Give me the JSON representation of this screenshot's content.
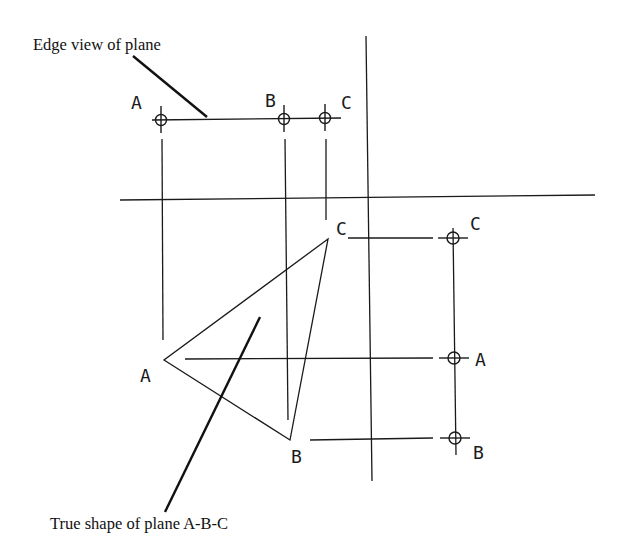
{
  "diagram": {
    "type": "descriptive-geometry-construction",
    "annotations": {
      "edge_view": "Edge view of plane",
      "true_shape": "True shape of plane A-B-C"
    },
    "reference_lines": {
      "vertical_fold_line": {
        "x1": 366,
        "y1": 36,
        "x2": 372,
        "y2": 481
      },
      "horizontal_fold_line": {
        "x1": 120,
        "y1": 200,
        "x2": 595,
        "y2": 195
      }
    },
    "top_view": {
      "description": "Edge view of plane (points collinear)",
      "points": [
        {
          "label": "A",
          "x": 161,
          "y": 120,
          "label_x": 131,
          "label_y": 109
        },
        {
          "label": "B",
          "x": 284,
          "y": 119,
          "label_x": 265,
          "label_y": 107
        },
        {
          "label": "C",
          "x": 325,
          "y": 118,
          "label_x": 341,
          "label_y": 109
        }
      ],
      "edge_line": {
        "x1": 152,
        "y1": 120,
        "x2": 341,
        "y2": 118
      }
    },
    "true_shape_view": {
      "description": "True shape triangle A-B-C",
      "points": [
        {
          "label": "A",
          "x": 164,
          "y": 360,
          "label_x": 140,
          "label_y": 382
        },
        {
          "label": "B",
          "x": 290,
          "y": 440,
          "label_x": 291,
          "label_y": 463
        },
        {
          "label": "C",
          "x": 328,
          "y": 239,
          "label_x": 336,
          "label_y": 235
        }
      ]
    },
    "side_view": {
      "description": "Side projection points",
      "points": [
        {
          "label": "C",
          "x": 453,
          "y": 238,
          "label_x": 470,
          "label_y": 230
        },
        {
          "label": "A",
          "x": 454,
          "y": 358,
          "label_x": 475,
          "label_y": 366
        },
        {
          "label": "B",
          "x": 455,
          "y": 438,
          "label_x": 473,
          "label_y": 459
        }
      ]
    }
  }
}
